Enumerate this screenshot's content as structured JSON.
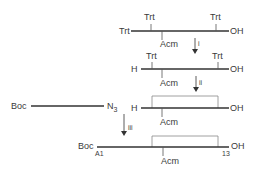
{
  "diagram": {
    "type": "peptide synthesis scheme",
    "colors": {
      "line": "#333333",
      "bracket": "#888888",
      "text": "#3a3a3a"
    },
    "row1": {
      "n_term": "Trt",
      "c_term": "OH",
      "top_groups": [
        "Trt",
        "Trt"
      ],
      "bottom_group": "Acm"
    },
    "step1": {
      "label": "i"
    },
    "row2": {
      "n_term": "H",
      "c_term": "OH",
      "top_groups": [
        "Trt",
        "Trt"
      ],
      "bottom_group": "Acm"
    },
    "step2": {
      "label": "ii"
    },
    "row3": {
      "n_term": "H",
      "c_term": "OH",
      "bottom_group": "Acm"
    },
    "fragment": {
      "n_term": "Boc",
      "c_term": "N",
      "c_term_sub": "3"
    },
    "step3": {
      "label": "iii"
    },
    "row4": {
      "n_term": "Boc",
      "c_term": "OH",
      "start_residue": "A1",
      "end_residue": "13",
      "bottom_group": "Acm"
    }
  }
}
